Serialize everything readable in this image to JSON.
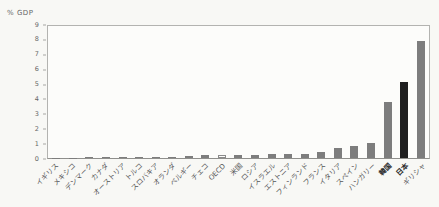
{
  "colors": {
    "bar": "#7d7d7d",
    "black_bar": "#1f1f1f",
    "outline_fill": "#fcfcfa",
    "outline_border": "#8a8a8a",
    "axis": "#a6a6a3",
    "text": "#5a5a5a",
    "background": "#f8f8f5"
  },
  "chart_data": {
    "type": "bar",
    "title": "",
    "ylabel": "% GDP",
    "xlabel": "",
    "ylim": [
      0,
      9
    ],
    "yticks": [
      0,
      1,
      2,
      3,
      4,
      5,
      6,
      7,
      8,
      9
    ],
    "grid": false,
    "legend_position": "none",
    "categories": [
      "イギリス",
      "メキシコ",
      "デンマーク",
      "カナダ",
      "オーストリア",
      "トルコ",
      "スロバキア",
      "オランダ",
      "ベルギー",
      "チェコ",
      "OECD",
      "米国",
      "ロシア",
      "イスラエル",
      "エストニア",
      "フィンランド",
      "フランス",
      "イタリア",
      "スペイン",
      "ハンガリー",
      "韓国",
      "日本",
      "ギリシャ"
    ],
    "values": [
      0.02,
      0.03,
      0.05,
      0.06,
      0.08,
      0.09,
      0.1,
      0.1,
      0.12,
      0.18,
      0.2,
      0.2,
      0.22,
      0.24,
      0.26,
      0.3,
      0.4,
      0.65,
      0.8,
      1.0,
      3.8,
      5.2,
      8.0
    ],
    "emphasis": {
      "black_bar_category": "日本",
      "outline_bar_category": "OECD",
      "bold_label_categories": [
        "韓国",
        "日本"
      ]
    }
  }
}
